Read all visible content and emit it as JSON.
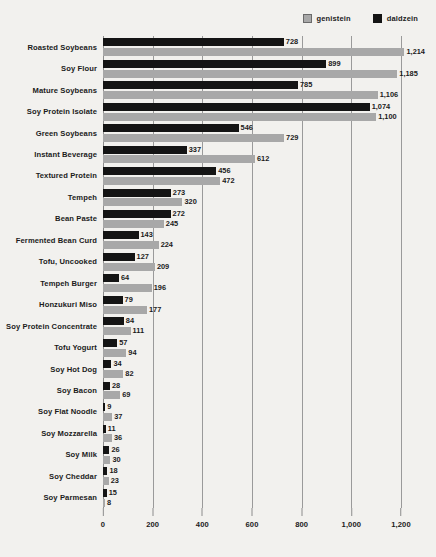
{
  "chart_data": {
    "type": "bar",
    "orientation": "horizontal",
    "title": "",
    "subtitle": "",
    "xlabel": "",
    "ylabel": "",
    "xlim": [
      0,
      1200
    ],
    "xticks": [
      0,
      200,
      400,
      600,
      800,
      1000,
      1200
    ],
    "xtick_labels": [
      "0",
      "200",
      "400",
      "600",
      "800",
      "1,000",
      "1,200"
    ],
    "grid": true,
    "grid_axis": "x",
    "legend_position": "top-right",
    "categories": [
      "Roasted Soybeans",
      "Soy Flour",
      "Mature Soybeans",
      "Soy Protein Isolate",
      "Green Soybeans",
      "Instant Beverage",
      "Textured Protein",
      "Tempeh",
      "Bean Paste",
      "Fermented Bean Curd",
      "Tofu, Uncooked",
      "Tempeh Burger",
      "Honzukuri Miso",
      "Soy Protein Concentrate",
      "Tofu Yogurt",
      "Soy Hot Dog",
      "Soy Bacon",
      "Soy Flat Noodle",
      "Soy Mozzarella",
      "Soy Milk",
      "Soy Cheddar",
      "Soy Parmesan"
    ],
    "series": [
      {
        "name": "daldzein",
        "color": "#141414",
        "values": [
          728,
          899,
          785,
          1074,
          546,
          337,
          456,
          273,
          272,
          143,
          127,
          64,
          79,
          84,
          57,
          34,
          28,
          9,
          11,
          26,
          18,
          15
        ],
        "value_labels": [
          "728",
          "899",
          "785",
          "1,074",
          "546",
          "337",
          "456",
          "273",
          "272",
          "143",
          "127",
          "64",
          "79",
          "84",
          "57",
          "34",
          "28",
          "9",
          "11",
          "26",
          "18",
          "15"
        ]
      },
      {
        "name": "genistein",
        "color": "#a8a8a8",
        "values": [
          1214,
          1185,
          1106,
          1100,
          729,
          612,
          472,
          320,
          245,
          224,
          209,
          196,
          177,
          111,
          94,
          82,
          69,
          37,
          36,
          30,
          23,
          8
        ],
        "value_labels": [
          "1,214",
          "1,185",
          "1,106",
          "1,100",
          "729",
          "612",
          "472",
          "320",
          "245",
          "224",
          "209",
          "196",
          "177",
          "111",
          "94",
          "82",
          "69",
          "37",
          "36",
          "30",
          "23",
          "8"
        ]
      }
    ]
  },
  "legend": {
    "entries": [
      {
        "label": "genistein",
        "swatch": "legend-swatch-genistein"
      },
      {
        "label": "daldzein",
        "swatch": "legend-swatch-daidzein"
      }
    ]
  }
}
